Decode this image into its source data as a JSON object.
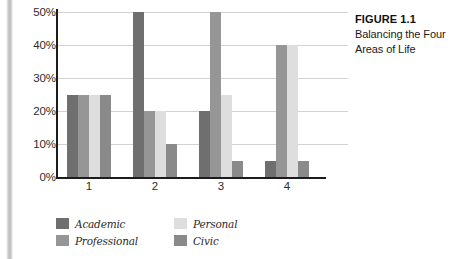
{
  "caption": {
    "title": "FIGURE 1.1",
    "text": "Balancing the Four Areas of Life"
  },
  "chart_data": {
    "type": "bar",
    "title": "Balancing the Four Areas of Life",
    "xlabel": "",
    "ylabel": "",
    "categories": [
      "1",
      "2",
      "3",
      "4"
    ],
    "series": [
      {
        "name": "Academic",
        "color": "#6f6f6f",
        "values": [
          25,
          50,
          20,
          5
        ]
      },
      {
        "name": "Professional",
        "color": "#969696",
        "values": [
          25,
          20,
          50,
          40
        ]
      },
      {
        "name": "Personal",
        "color": "#dedede",
        "values": [
          25,
          20,
          25,
          40
        ]
      },
      {
        "name": "Civic",
        "color": "#8a8a8a",
        "values": [
          25,
          10,
          5,
          5
        ]
      }
    ],
    "ylim": [
      0,
      50
    ],
    "yticks": [
      0,
      10,
      20,
      30,
      40,
      50
    ],
    "ytick_labels": [
      "0%",
      "10%",
      "20%",
      "30%",
      "40%",
      "50%"
    ],
    "grid": true,
    "legend_position": "bottom-left",
    "legend_order": [
      "Academic",
      "Personal",
      "Professional",
      "Civic"
    ]
  },
  "colors": {
    "axis": "#1c1c1c",
    "gridline": "#d2d2d2",
    "text": "#2b2b2b",
    "background": "#ffffff"
  }
}
